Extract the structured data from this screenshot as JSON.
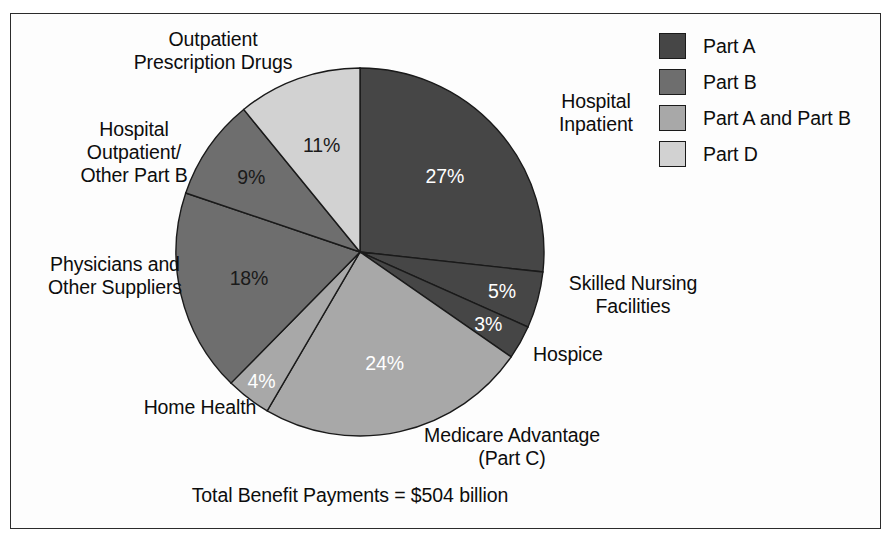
{
  "figure": {
    "total_caption": "Total Benefit Payments = $504 billion"
  },
  "legend": {
    "items": [
      {
        "label": "Part A",
        "color": "#464646"
      },
      {
        "label": "Part B",
        "color": "#6e6e6e"
      },
      {
        "label": "Part A and Part B",
        "color": "#a8a8a8"
      },
      {
        "label": "Part D",
        "color": "#d2d2d2"
      }
    ]
  },
  "labels": {
    "outpatient_rx": "Outpatient\nPrescription Drugs",
    "hospital_outpatient": "Hospital\nOutpatient/\nOther Part B",
    "physicians": "Physicians and\nOther Suppliers",
    "home_health": "Home Health",
    "medicare_advantage": "Medicare Advantage\n(Part C)",
    "hospice": "Hospice",
    "skilled_nursing": "Skilled Nursing\nFacilities",
    "hospital_inpatient": "Hospital\nInpatient"
  },
  "chart_data": {
    "type": "pie",
    "title": "",
    "total_label": "Total Benefit Payments = $504 billion",
    "total_value": 504,
    "total_units": "billion USD",
    "start_angle_deg": 0,
    "direction": "clockwise",
    "legend_position": "top-right",
    "categories": [
      "Hospital Inpatient",
      "Skilled Nursing Facilities",
      "Hospice",
      "Medicare Advantage (Part C)",
      "Home Health",
      "Physicians and Other Suppliers",
      "Hospital Outpatient/Other Part B",
      "Outpatient Prescription Drugs"
    ],
    "values": [
      27,
      5,
      3,
      24,
      4,
      18,
      9,
      11
    ],
    "value_labels": [
      "27%",
      "5%",
      "3%",
      "24%",
      "4%",
      "18%",
      "9%",
      "11%"
    ],
    "units": "percent",
    "groups": [
      "Part A",
      "Part A",
      "Part A",
      "Part A and Part B",
      "Part A and Part B",
      "Part B",
      "Part B",
      "Part D"
    ],
    "colors": [
      "#464646",
      "#464646",
      "#464646",
      "#a8a8a8",
      "#a8a8a8",
      "#6e6e6e",
      "#6e6e6e",
      "#d2d2d2"
    ],
    "label_text_colors": [
      "#ffffff",
      "#ffffff",
      "#ffffff",
      "#ffffff",
      "#ffffff",
      "#1a1a1a",
      "#1a1a1a",
      "#1a1a1a"
    ]
  }
}
